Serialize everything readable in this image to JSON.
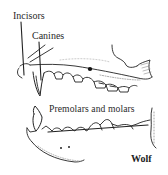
{
  "diagram": {
    "title": "Wolf",
    "labels": {
      "incisors": "Incisors",
      "canines": "Canines",
      "premolars_molars": "Premolars and molars"
    },
    "colors": {
      "ink": "#222222",
      "background": "#ffffff"
    },
    "parts": [
      "upper-jaw",
      "lower-jaw",
      "incisors",
      "canines",
      "premolars",
      "molars"
    ]
  }
}
